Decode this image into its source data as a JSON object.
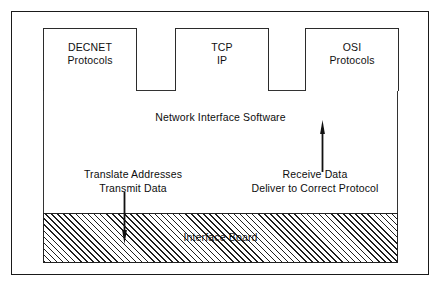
{
  "figure": {
    "protocol_boxes": [
      {
        "name": "decnet",
        "lines": [
          "DECNET",
          "Protocols"
        ]
      },
      {
        "name": "tcpip",
        "lines": [
          "TCP",
          "IP"
        ]
      },
      {
        "name": "osi",
        "lines": [
          "OSI",
          "Protocols"
        ]
      }
    ],
    "network_interface_software": {
      "title": "Network Interface Software",
      "fill": "dotted-stipple",
      "fill_color": "#4a4a4a"
    },
    "interface_board": {
      "title": "Interface Board",
      "fill": "diagonal-hatch",
      "fill_color": "#1f1f1f"
    },
    "annotations": [
      {
        "name": "transmit",
        "lines": [
          "Translate Addresses",
          "Transmit Data"
        ],
        "arrow_direction": "down"
      },
      {
        "name": "receive",
        "lines": [
          "Receive Data",
          "Deliver to Correct Protocol"
        ],
        "arrow_direction": "up"
      }
    ],
    "colors": {
      "frame": "#1a1a1a",
      "text": "#0d0d0d",
      "background": "#ffffff"
    }
  }
}
